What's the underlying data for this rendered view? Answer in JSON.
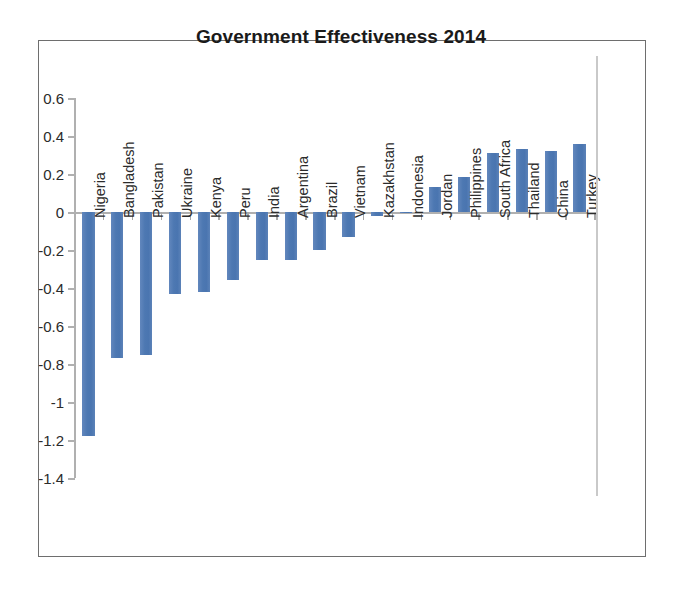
{
  "chart_data": {
    "type": "bar",
    "title": "Government Effectiveness 2014",
    "xlabel": "",
    "ylabel": "",
    "ylim": [
      -1.4,
      0.6
    ],
    "ytick_step": 0.2,
    "ytick_labels": [
      "0.6",
      "0.4",
      "0.2",
      "0",
      "-0.2",
      "-0.4",
      "-0.6",
      "-0.8",
      "-1",
      "-1.2",
      "-1.4"
    ],
    "ytick_values": [
      0.6,
      0.4,
      0.2,
      0,
      -0.2,
      -0.4,
      -0.6,
      -0.8,
      -1,
      -1.2,
      -1.4
    ],
    "grid": false,
    "legend": false,
    "bar_color": "#4F7CB5",
    "categories": [
      "Nigeria",
      "Bangladesh",
      "Pakistan",
      "Ukraine",
      "Kenya",
      "Peru",
      "India",
      "Argentina",
      "Brazil",
      "Vietnam",
      "Kazakhstan",
      "Indonesia",
      "Jordan",
      "Philippines",
      "South Africa",
      "Thailand",
      "China",
      "Turkey"
    ],
    "values": [
      -1.18,
      -0.77,
      -0.75,
      -0.43,
      -0.42,
      -0.36,
      -0.25,
      -0.25,
      -0.2,
      -0.13,
      -0.02,
      0.0,
      0.13,
      0.185,
      0.31,
      0.33,
      0.32,
      0.36
    ]
  }
}
